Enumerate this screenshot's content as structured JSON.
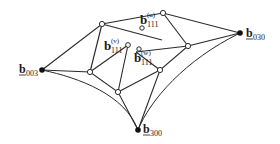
{
  "diagram": {
    "type": "bezier-triangle-control-net",
    "colors": {
      "line": "#2a2a2a",
      "background": "#ffffff",
      "node_fill_open": "#ffffff",
      "node_fill_corner": "#111111"
    },
    "corner_points": [
      {
        "id": "b003",
        "base": "b",
        "sub": "003",
        "x": 42,
        "y": 70
      },
      {
        "id": "b030",
        "base": "b",
        "sub": "030",
        "x": 240,
        "y": 33
      },
      {
        "id": "b300",
        "base": "b",
        "sub": "300",
        "x": 138,
        "y": 130
      }
    ],
    "interior_labels": [
      {
        "id": "b111u",
        "base": "b",
        "sub": "111",
        "sup": "(u)"
      },
      {
        "id": "b111v",
        "base": "b",
        "sub": "111",
        "sup": "(v)"
      },
      {
        "id": "b111w",
        "base": "b",
        "sub": "111",
        "sup": "(w)"
      }
    ]
  }
}
